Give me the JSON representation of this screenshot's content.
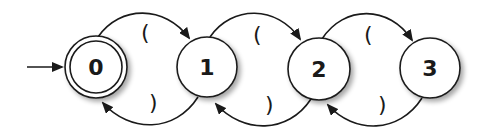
{
  "diagram": {
    "type": "state-machine",
    "colors": {
      "stroke": "#1a1a1a",
      "fill": "#ffffff",
      "shadow": "#c8c8c8"
    },
    "start_state": "0",
    "states": [
      {
        "id": "0",
        "label": "0",
        "accepting": true,
        "cx": 96,
        "cy": 67,
        "r": 31
      },
      {
        "id": "1",
        "label": "1",
        "accepting": false,
        "cx": 207,
        "cy": 67,
        "r": 30
      },
      {
        "id": "2",
        "label": "2",
        "accepting": false,
        "cx": 319,
        "cy": 69,
        "r": 31
      },
      {
        "id": "3",
        "label": "3",
        "accepting": false,
        "cx": 430,
        "cy": 68,
        "r": 30
      }
    ],
    "transitions": [
      {
        "from": "0",
        "to": "1",
        "label": "("
      },
      {
        "from": "1",
        "to": "0",
        "label": ")"
      },
      {
        "from": "1",
        "to": "2",
        "label": "("
      },
      {
        "from": "2",
        "to": "1",
        "label": ")"
      },
      {
        "from": "2",
        "to": "3",
        "label": "("
      },
      {
        "from": "3",
        "to": "2",
        "label": ")"
      }
    ]
  }
}
